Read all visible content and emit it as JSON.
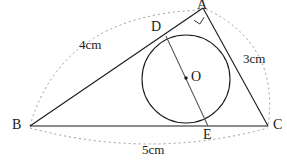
{
  "figure": {
    "type": "euclidean-geometry-diagram",
    "canvas": {
      "width": 287,
      "height": 164,
      "background": "#ffffff"
    },
    "stroke": {
      "solid_color": "#1a1a1a",
      "dashed_color": "#9a9a9a",
      "solid_width": 1.1,
      "dashed_width": 1.0,
      "dash_pattern": "2,3"
    }
  },
  "vertices": [
    {
      "name": "A",
      "label": "A",
      "x": 203,
      "y": 8,
      "label_x": 197,
      "label_y": 0,
      "angle_marker": "right-angle"
    },
    {
      "name": "B",
      "label": "B",
      "x": 30,
      "y": 126,
      "label_x": 12,
      "label_y": 121,
      "angle_marker": "none"
    },
    {
      "name": "C",
      "label": "C",
      "x": 268,
      "y": 126,
      "label_x": 274,
      "label_y": 121,
      "angle_marker": "none"
    },
    {
      "name": "D",
      "label": "D",
      "x": 166,
      "y": 36,
      "label_x": 152,
      "label_y": 22,
      "angle_marker": "none"
    },
    {
      "name": "E",
      "label": "E",
      "x": 208,
      "y": 126,
      "label_x": 203,
      "label_y": 128,
      "angle_marker": "none"
    },
    {
      "name": "O",
      "label": "O",
      "x": 186,
      "y": 78,
      "label_x": 191,
      "label_y": 70,
      "angle_marker": "center-dot"
    }
  ],
  "circle": {
    "name": "inscribed-circle",
    "center_x": 186,
    "center_y": 79,
    "radius": 44
  },
  "segments": [
    {
      "name": "side-AB",
      "from": "B",
      "to": "A",
      "style": "solid"
    },
    {
      "name": "side-BC",
      "from": "B",
      "to": "C",
      "style": "solid"
    },
    {
      "name": "side-AC",
      "from": "A",
      "to": "C",
      "style": "solid"
    },
    {
      "name": "chord-DE",
      "from": "D",
      "to": "E",
      "style": "solid"
    }
  ],
  "arcs": [
    {
      "name": "arc-AB",
      "label": "4cm",
      "from": "B",
      "to": "A",
      "bulge": "outward-upper-left"
    },
    {
      "name": "arc-AC",
      "label": "3cm",
      "from": "A",
      "to": "C",
      "bulge": "outward-right"
    },
    {
      "name": "arc-BC",
      "label": "5cm",
      "from": "B",
      "to": "C",
      "bulge": "outward-below"
    }
  ],
  "measurements": [
    {
      "name": "length-AB",
      "text": "4cm",
      "x": 79,
      "y": 38
    },
    {
      "name": "length-AC",
      "text": "3cm",
      "x": 243,
      "y": 52
    },
    {
      "name": "length-BC",
      "text": "5cm",
      "x": 142,
      "y": 143
    }
  ]
}
